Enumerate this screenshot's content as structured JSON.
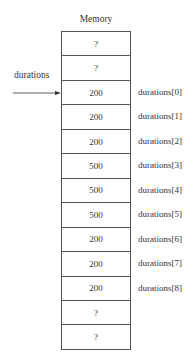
{
  "diagram": {
    "title": "Memory",
    "pointer": {
      "label": "durations",
      "points_to_index": 2
    },
    "cells": [
      {
        "value": "?",
        "label": ""
      },
      {
        "value": "?",
        "label": ""
      },
      {
        "value": "200",
        "label": "durations[0]"
      },
      {
        "value": "200",
        "label": "durations[1]"
      },
      {
        "value": "200",
        "label": "durations[2]"
      },
      {
        "value": "500",
        "label": "durations[3]"
      },
      {
        "value": "500",
        "label": "durations[4]"
      },
      {
        "value": "500",
        "label": "durations[5]"
      },
      {
        "value": "200",
        "label": "durations[6]"
      },
      {
        "value": "200",
        "label": "durations[7]"
      },
      {
        "value": "200",
        "label": "durations[8]"
      },
      {
        "value": "?",
        "label": ""
      },
      {
        "value": "?",
        "label": ""
      }
    ]
  }
}
